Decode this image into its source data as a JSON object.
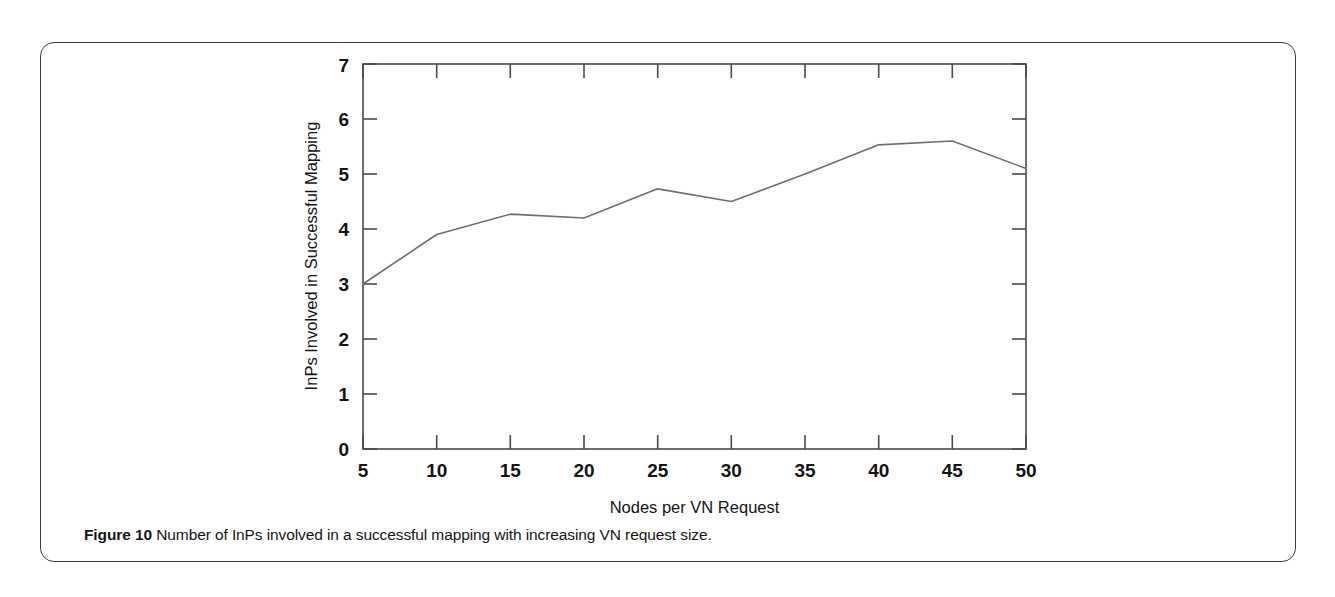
{
  "figure": {
    "caption_label": "Figure 10",
    "caption_text": " Number of InPs involved in a successful mapping with increasing VN request size."
  },
  "chart_data": {
    "type": "line",
    "title": "",
    "xlabel": "Nodes per VN Request",
    "ylabel": "InPs Involved in Successful Mapping",
    "x": [
      5,
      10,
      15,
      20,
      25,
      30,
      35,
      40,
      45,
      50
    ],
    "values": [
      3.0,
      3.9,
      4.27,
      4.2,
      4.73,
      4.5,
      5.0,
      5.53,
      5.6,
      5.1
    ],
    "series": [
      {
        "name": "InPs involved",
        "values": [
          3.0,
          3.9,
          4.27,
          4.2,
          4.73,
          4.5,
          5.0,
          5.53,
          5.6,
          5.1
        ]
      }
    ],
    "xlim": [
      5,
      50
    ],
    "ylim": [
      0,
      7
    ],
    "xticks": [
      "5",
      "10",
      "15",
      "20",
      "25",
      "30",
      "35",
      "40",
      "45",
      "50"
    ],
    "yticks": [
      "0",
      "1",
      "2",
      "3",
      "4",
      "5",
      "6",
      "7"
    ],
    "grid": false,
    "legend": "none",
    "line_color": "#6e6e6e",
    "axis_color": "#4a4a4a"
  }
}
